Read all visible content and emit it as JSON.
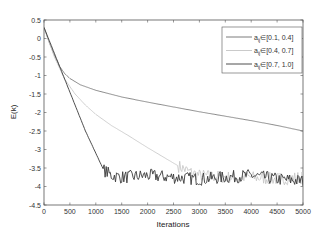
{
  "chart_data": {
    "type": "line",
    "title": "",
    "xlabel": "Iterations",
    "ylabel": "E(k)",
    "xlim": [
      0,
      5000
    ],
    "ylim": [
      -4.5,
      0.5
    ],
    "xticks": [
      0,
      500,
      1000,
      1500,
      2000,
      2500,
      3000,
      3500,
      4000,
      4500,
      5000
    ],
    "yticks": [
      0.5,
      0,
      -0.5,
      -1,
      -1.5,
      -2,
      -2.5,
      -3,
      -3.5,
      -4,
      -4.5
    ],
    "grid": false,
    "legend_position": "upper right",
    "series": [
      {
        "name": "a_ij∈[0.1, 0.4]",
        "legend_sub": "ij",
        "legend_text": "∈[0.1, 0.4]",
        "color": "#6e6e6e",
        "x": [
          0,
          100,
          200,
          300,
          400,
          500,
          700,
          1000,
          1500,
          2000,
          2500,
          3000,
          3500,
          4000,
          4500,
          5000
        ],
        "values": [
          0.3,
          -0.1,
          -0.45,
          -0.75,
          -0.95,
          -1.08,
          -1.25,
          -1.4,
          -1.58,
          -1.72,
          -1.85,
          -1.98,
          -2.1,
          -2.22,
          -2.35,
          -2.5
        ]
      },
      {
        "name": "a_ij∈[0.4, 0.7]",
        "legend_sub": "ij",
        "legend_text": "∈[0.4, 0.7]",
        "color": "#c4c4c4",
        "x": [
          0,
          200,
          400,
          600,
          800,
          1000,
          1300,
          1600,
          2000,
          2300,
          2600,
          2800,
          3000,
          3500,
          4000,
          4500,
          5000
        ],
        "values": [
          0.3,
          -0.5,
          -1.1,
          -1.5,
          -1.8,
          -2.05,
          -2.35,
          -2.6,
          -2.95,
          -3.2,
          -3.45,
          -3.6,
          -3.7,
          -3.75,
          -3.75,
          -3.8,
          -3.75
        ]
      },
      {
        "name": "a_ij∈[0.7, 1.0]",
        "legend_sub": "ij",
        "legend_text": "∈[0.7, 1.0]",
        "color": "#3a3a3a",
        "x": [
          0,
          200,
          400,
          600,
          800,
          1000,
          1150,
          1300,
          1500,
          2000,
          2500,
          3000,
          3500,
          4000,
          4500,
          5000
        ],
        "values": [
          0.3,
          -0.4,
          -1.1,
          -1.8,
          -2.5,
          -3.1,
          -3.55,
          -3.7,
          -3.75,
          -3.7,
          -3.75,
          -3.8,
          -3.75,
          -3.7,
          -3.8,
          -3.85
        ]
      }
    ]
  }
}
